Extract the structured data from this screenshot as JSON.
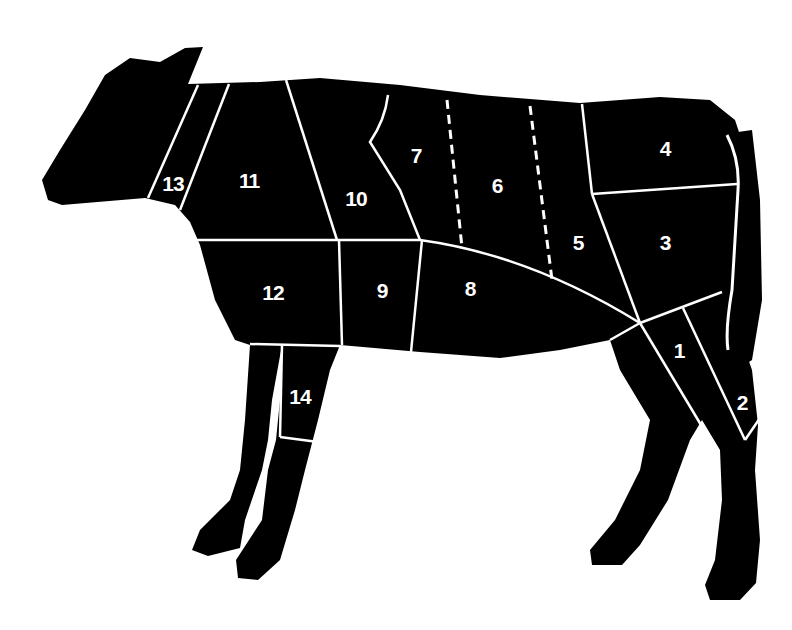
{
  "diagram": {
    "colors": {
      "body": "#000000",
      "lines": "#ffffff",
      "background": "#ffffff"
    },
    "cuts": [
      {
        "number": "1",
        "x": 679,
        "y": 351
      },
      {
        "number": "2",
        "x": 742,
        "y": 403
      },
      {
        "number": "3",
        "x": 665,
        "y": 243
      },
      {
        "number": "4",
        "x": 665,
        "y": 149
      },
      {
        "number": "5",
        "x": 578,
        "y": 243
      },
      {
        "number": "6",
        "x": 497,
        "y": 186
      },
      {
        "number": "7",
        "x": 416,
        "y": 156
      },
      {
        "number": "8",
        "x": 470,
        "y": 289
      },
      {
        "number": "9",
        "x": 382,
        "y": 291
      },
      {
        "number": "10",
        "x": 356,
        "y": 199
      },
      {
        "number": "11",
        "x": 249,
        "y": 181
      },
      {
        "number": "12",
        "x": 273,
        "y": 293
      },
      {
        "number": "13",
        "x": 173,
        "y": 184
      },
      {
        "number": "14",
        "x": 300,
        "y": 397
      }
    ]
  }
}
